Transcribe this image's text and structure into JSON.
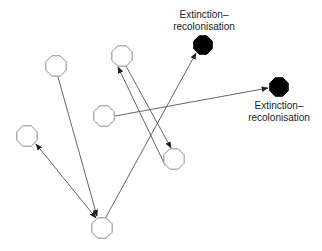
{
  "diagram": {
    "colors": {
      "background": "#ffffff",
      "patch_stroke": "#8a8a8a",
      "patch_fill": "#ffffff",
      "extinct_fill": "#000000",
      "edge": "#555555"
    },
    "nodes": [
      {
        "id": "A",
        "type": "occupied",
        "cx": 56,
        "cy": 66,
        "r": 11
      },
      {
        "id": "B",
        "type": "occupied",
        "cx": 122,
        "cy": 56,
        "r": 11
      },
      {
        "id": "C",
        "type": "occupied",
        "cx": 104,
        "cy": 116,
        "r": 11
      },
      {
        "id": "D",
        "type": "occupied",
        "cx": 27,
        "cy": 136,
        "r": 11
      },
      {
        "id": "E",
        "type": "occupied",
        "cx": 102,
        "cy": 228,
        "r": 11
      },
      {
        "id": "F",
        "type": "occupied",
        "cx": 174,
        "cy": 159,
        "r": 11
      },
      {
        "id": "G",
        "type": "extinct",
        "cx": 203,
        "cy": 45,
        "r": 10
      },
      {
        "id": "H",
        "type": "extinct",
        "cx": 279,
        "cy": 87,
        "r": 10
      }
    ],
    "edges": [
      {
        "from": "A",
        "to": "E",
        "x1": 58,
        "y1": 77,
        "x2": 97,
        "y2": 216,
        "arrow_end": true,
        "arrow_start": false
      },
      {
        "from": "D",
        "to": "E",
        "x1": 36,
        "y1": 144,
        "x2": 96,
        "y2": 218,
        "arrow_end": true,
        "arrow_start": true
      },
      {
        "from": "E",
        "to": "G",
        "x1": 106,
        "y1": 217,
        "x2": 196,
        "y2": 53,
        "arrow_end": true,
        "arrow_start": false
      },
      {
        "from": "F",
        "to": "B",
        "x1": 165,
        "y1": 165,
        "x2": 118,
        "y2": 67,
        "arrow_end": true,
        "arrow_start": false
      },
      {
        "from": "B",
        "to": "F",
        "x1": 126,
        "y1": 66,
        "x2": 171,
        "y2": 148,
        "arrow_end": true,
        "arrow_start": false
      },
      {
        "from": "C",
        "to": "H",
        "x1": 115,
        "y1": 116,
        "x2": 268,
        "y2": 88,
        "arrow_end": true,
        "arrow_start": false
      }
    ],
    "labels": [
      {
        "id": "label-G",
        "line1": "Extinction–",
        "line2": "recolonisation",
        "x": 165,
        "y": 9,
        "w": 78
      },
      {
        "id": "label-H",
        "line1": "Extinction–",
        "line2": "recolonisation",
        "x": 240,
        "y": 100,
        "w": 78
      }
    ]
  }
}
